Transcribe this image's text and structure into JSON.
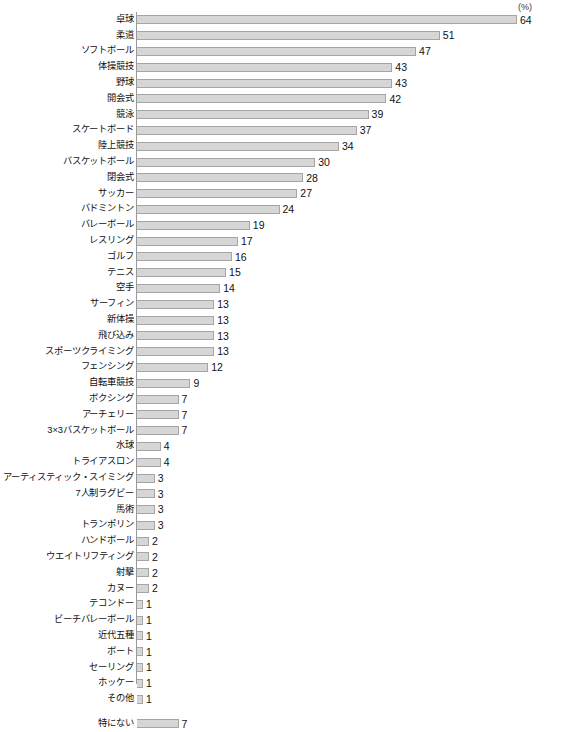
{
  "chart_data": {
    "type": "bar",
    "orientation": "horizontal",
    "title": "",
    "xlabel": "",
    "ylabel": "",
    "unit_label": "(%)",
    "xlim": [
      0,
      64
    ],
    "grid": false,
    "legend": null,
    "categories": [
      "卓球",
      "柔道",
      "ソフトボール",
      "体操競技",
      "野球",
      "開会式",
      "競泳",
      "スケートボード",
      "陸上競技",
      "バスケットボール",
      "閉会式",
      "サッカー",
      "バドミントン",
      "バレーボール",
      "レスリング",
      "ゴルフ",
      "テニス",
      "空手",
      "サーフィン",
      "新体操",
      "飛び込み",
      "スポーツクライミング",
      "フェンシング",
      "自転車競技",
      "ボクシング",
      "アーチェリー",
      "3×3バスケットボール",
      "水球",
      "トライアスロン",
      "アーティスティック・スイミング",
      "7人制ラグビー",
      "馬術",
      "トランポリン",
      "ハンドボール",
      "ウエイトリフティング",
      "射撃",
      "カヌー",
      "テコンドー",
      "ビーチバレーボール",
      "近代五種",
      "ボート",
      "セーリング",
      "ホッケー",
      "その他",
      "特にない"
    ],
    "values": [
      64,
      51,
      47,
      43,
      43,
      42,
      39,
      37,
      34,
      30,
      28,
      27,
      24,
      19,
      17,
      16,
      15,
      14,
      13,
      13,
      13,
      13,
      12,
      9,
      7,
      7,
      7,
      4,
      4,
      3,
      3,
      3,
      3,
      2,
      2,
      2,
      2,
      1,
      1,
      1,
      1,
      1,
      1,
      1,
      7
    ],
    "separated_after_index": 43,
    "colors": {
      "bar_fill": "#d6d6d6",
      "bar_border": "#a5a5a5",
      "axis": "#9a9a9a",
      "text": "#111111"
    }
  }
}
